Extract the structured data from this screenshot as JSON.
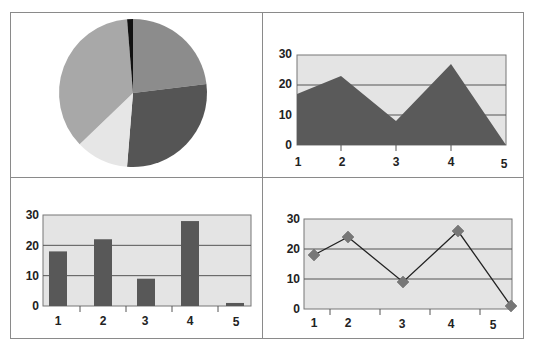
{
  "chart_data": [
    {
      "type": "pie",
      "title": "",
      "categories": [
        "1",
        "2",
        "3",
        "4",
        "5"
      ],
      "values": [
        18,
        22,
        9,
        28,
        1
      ],
      "slice_order_clockwise_from_top": [
        "medium-gray",
        "dark-gray",
        "very-light-gray",
        "light-gray",
        "black"
      ],
      "colors": [
        "#8c8c8c",
        "#555555",
        "#e6e6e6",
        "#a8a8a8",
        "#111111"
      ],
      "legend": "none"
    },
    {
      "type": "area",
      "title": "",
      "categories": [
        "1",
        "2",
        "3",
        "4",
        "5"
      ],
      "values": [
        17,
        23,
        8,
        27,
        0
      ],
      "xlabel": "",
      "ylabel": "",
      "ylim": [
        0,
        30
      ],
      "yticks": [
        "0",
        "10",
        "20",
        "30"
      ],
      "grid": true,
      "fill_color": "#5a5a5a",
      "plot_bg": "#e4e4e4"
    },
    {
      "type": "bar",
      "title": "",
      "categories": [
        "1",
        "2",
        "3",
        "4",
        "5"
      ],
      "values": [
        18,
        22,
        9,
        28,
        1
      ],
      "xlabel": "",
      "ylabel": "",
      "ylim": [
        0,
        30
      ],
      "yticks": [
        "0",
        "10",
        "20",
        "30"
      ],
      "grid": true,
      "bar_color": "#585858",
      "plot_bg": "#e4e4e4"
    },
    {
      "type": "line",
      "title": "",
      "categories": [
        "1",
        "2",
        "3",
        "4",
        "5"
      ],
      "values": [
        18,
        24,
        9,
        26,
        1
      ],
      "marker": "diamond",
      "xlabel": "",
      "ylabel": "",
      "ylim": [
        0,
        30
      ],
      "yticks": [
        "0",
        "10",
        "20",
        "30"
      ],
      "grid": true,
      "line_color": "#222222",
      "marker_color": "#777777",
      "plot_bg": "#e4e4e4"
    }
  ],
  "labels": {
    "y": [
      "0",
      "10",
      "20",
      "30"
    ],
    "x": [
      "1",
      "2",
      "3",
      "4",
      "5"
    ]
  }
}
